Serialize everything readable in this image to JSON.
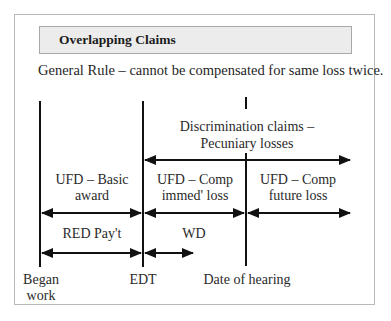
{
  "header": {
    "title": "Overlapping Claims"
  },
  "rule": {
    "text": "General Rule – cannot be compensated for same loss twice."
  },
  "timeline": {
    "markers": [
      {
        "label_line1": "Began",
        "label_line2": "work"
      },
      {
        "label_line1": "EDT"
      },
      {
        "label_line1": "Date of hearing"
      }
    ],
    "segments": {
      "discrimination": {
        "line1": "Discrimination claims –",
        "line2": "Pecuniary losses"
      },
      "basic_award": {
        "line1": "UFD – Basic",
        "line2": "award"
      },
      "comp_immed": {
        "line1": "UFD – Comp",
        "line2": "immed' loss"
      },
      "comp_future": {
        "line1": "UFD – Comp",
        "line2": "future loss"
      },
      "red_pay": {
        "line1": "RED Pay't"
      },
      "wd": {
        "line1": "WD"
      }
    }
  },
  "colors": {
    "line": "#111111",
    "header_bg": "#ececec",
    "frame_border": "#b9b9b9"
  }
}
